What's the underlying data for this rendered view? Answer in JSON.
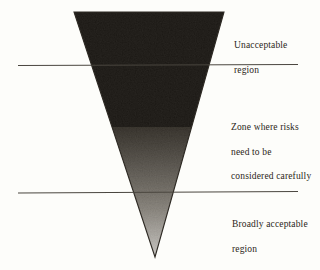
{
  "figure": {
    "kind": "alarp-risk-triangle",
    "background_color": "#fdfdfa",
    "canvas": {
      "width": 320,
      "height": 270
    }
  },
  "triangle": {
    "name": "inverted-risk-triangle",
    "top_left": {
      "x": 74,
      "y": 12
    },
    "top_right": {
      "x": 224,
      "y": 12
    },
    "apex": {
      "x": 155,
      "y": 257
    },
    "outline_color": "#2e2a24",
    "solid_fill_color": "#1e1a15",
    "solid_fill_bottom_y": 127,
    "gradient_top_color": "#3a352d",
    "gradient_mid_color": "#8e8a82",
    "gradient_bottom_color": "#e8e6e1"
  },
  "divider_lines": [
    {
      "name": "upper-threshold-line",
      "y": 65,
      "x_start": 18,
      "x_end": 298,
      "color": "#4a463f"
    },
    {
      "name": "lower-threshold-line",
      "y": 192,
      "x_start": 18,
      "x_end": 298,
      "color": "#4a463f"
    }
  ],
  "labels": {
    "unacceptable": {
      "lines": [
        "Unacceptable",
        "region"
      ],
      "text": "Unacceptable\nregion"
    },
    "alarp": {
      "lines": [
        "Zone where risks",
        "need to be",
        "considered carefully"
      ],
      "text": "Zone where risks\nneed to be\nconsidered carefully"
    },
    "broadly_acceptable": {
      "lines": [
        "Broadly acceptable",
        "region"
      ],
      "text": "Broadly acceptable\nregion"
    }
  }
}
